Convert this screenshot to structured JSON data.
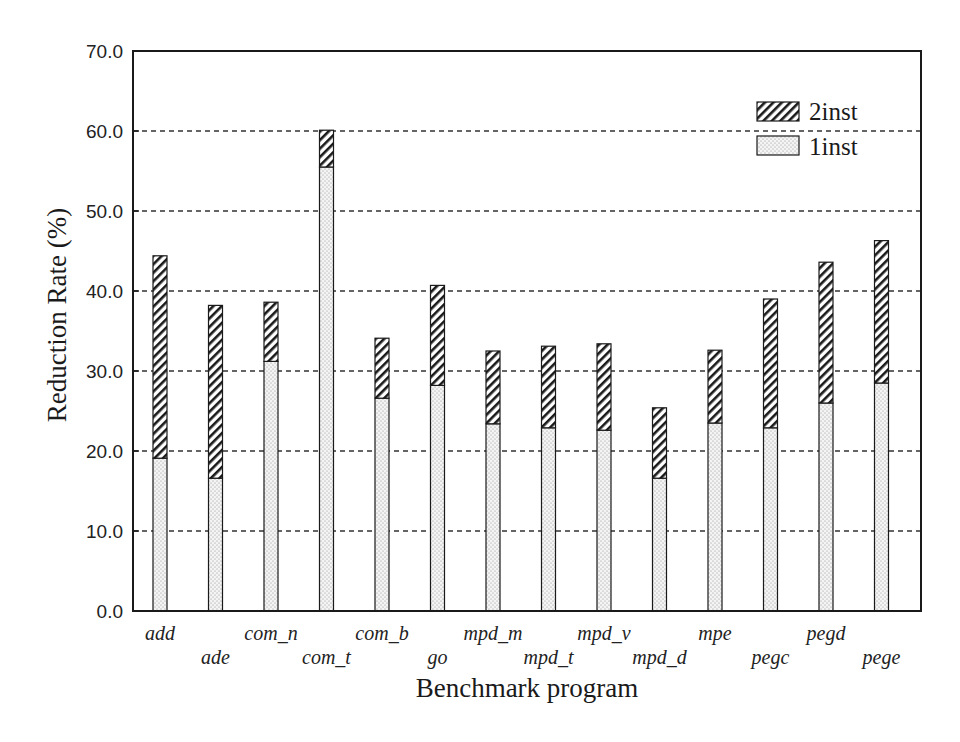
{
  "chart_data": {
    "type": "bar",
    "stacked": true,
    "title": "",
    "xlabel": "Benchmark program",
    "ylabel": "Reduction Rate (%)",
    "ylim": [
      0,
      70
    ],
    "yticks": [
      "0.0",
      "10.0",
      "20.0",
      "30.0",
      "40.0",
      "50.0",
      "60.0",
      "70.0"
    ],
    "grid": "horizontal dashed",
    "legend_position": "upper right",
    "categories": [
      "add",
      "ade",
      "com_n",
      "com_t",
      "com_b",
      "go",
      "mpd_m",
      "mpd_t",
      "mpd_v",
      "mpd_d",
      "mpe",
      "pegc",
      "pegd",
      "pege"
    ],
    "series": [
      {
        "name": "1inst",
        "pattern": "dotted",
        "values": [
          19.1,
          16.6,
          31.2,
          55.5,
          26.6,
          28.2,
          23.4,
          22.9,
          22.6,
          16.6,
          23.5,
          22.9,
          26.0,
          28.5
        ]
      },
      {
        "name": "2inst",
        "pattern": "hatched",
        "values": [
          25.3,
          21.6,
          7.4,
          4.6,
          7.5,
          12.5,
          9.1,
          10.2,
          10.8,
          8.8,
          9.1,
          16.1,
          17.6,
          17.8
        ]
      }
    ],
    "totals": [
      44.4,
      38.2,
      38.6,
      60.1,
      34.1,
      40.7,
      32.5,
      33.1,
      33.4,
      25.4,
      32.6,
      39.0,
      43.6,
      46.3
    ],
    "label_rows": [
      0,
      1,
      0,
      1,
      0,
      1,
      0,
      1,
      0,
      1,
      0,
      1,
      0,
      1
    ],
    "legend": [
      {
        "label": "2inst",
        "pattern": "hatched"
      },
      {
        "label": "1inst",
        "pattern": "dotted"
      }
    ]
  }
}
